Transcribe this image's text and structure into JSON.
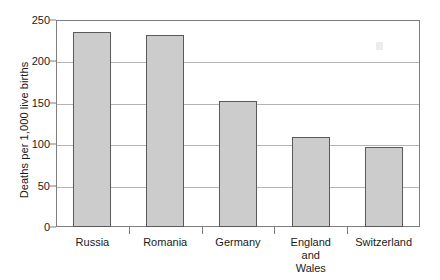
{
  "chart_data": {
    "type": "bar",
    "title": "",
    "xlabel": "",
    "ylabel": "Deaths per 1,000 live births",
    "categories": [
      "Russia",
      "Romania",
      "Germany",
      "England and Wales",
      "Switzerland"
    ],
    "category_lines": [
      [
        "Russia"
      ],
      [
        "Romania"
      ],
      [
        "Germany"
      ],
      [
        "England",
        "and",
        "Wales"
      ],
      [
        "Switzerland"
      ]
    ],
    "values": [
      236,
      232,
      152,
      109,
      97
    ],
    "ylim": [
      0,
      250
    ],
    "yticks": [
      0,
      50,
      100,
      150,
      200,
      250
    ],
    "ytick_labels": [
      "0",
      "50",
      "100",
      "150",
      "200",
      "250"
    ],
    "grid": true,
    "legend": "none",
    "bar_fill_color": "#cccccc",
    "bar_edge_color": "#5a5a5a",
    "gridline_color": "#b4b4b4",
    "axis_color": "#7d7d7d",
    "background_color": "#ffffff"
  }
}
